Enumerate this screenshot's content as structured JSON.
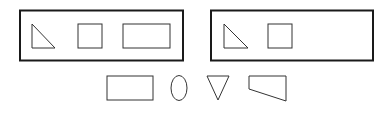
{
  "figure": {
    "background": "#ffffff",
    "stroke_color": "#1a1a1a",
    "groups": [
      {
        "name": "left-group",
        "frame": {
          "x": 20,
          "y": 10.5,
          "w": 163,
          "h": 50
        },
        "shapes": [
          {
            "type": "right-triangle",
            "points": "32,24 32,48 55,48"
          },
          {
            "type": "square",
            "x": 78,
            "y": 24,
            "w": 24,
            "h": 24
          },
          {
            "type": "rectangle",
            "x": 123,
            "y": 24,
            "w": 47,
            "h": 24
          }
        ]
      },
      {
        "name": "right-group",
        "frame": {
          "x": 211,
          "y": 10.5,
          "w": 162,
          "h": 50
        },
        "shapes": [
          {
            "type": "right-triangle",
            "points": "224,24 224,48 248,48"
          },
          {
            "type": "square",
            "x": 268,
            "y": 24,
            "w": 24,
            "h": 24
          }
        ]
      }
    ],
    "options": [
      {
        "type": "rectangle",
        "x": 107,
        "y": 76,
        "w": 46,
        "h": 24
      },
      {
        "type": "ellipse",
        "cx": 179,
        "cy": 88,
        "rx": 8,
        "ry": 12.5
      },
      {
        "type": "inverted-triangle",
        "points": "207,76 229,76 218,100"
      },
      {
        "type": "trapezoid",
        "points": "249,76 286,76 286,101 249,89"
      }
    ]
  }
}
